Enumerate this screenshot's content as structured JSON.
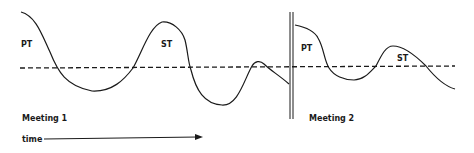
{
  "diagram": {
    "colors": {
      "line": "#1a1a1a",
      "background": "#ffffff"
    },
    "baseline": {
      "style": "dashed",
      "y": 68
    },
    "meetings": [
      {
        "label": "Meeting 1",
        "phase_labels": [
          {
            "text": "PT"
          },
          {
            "text": "ST"
          }
        ]
      },
      {
        "label": "Meeting 2",
        "phase_labels": [
          {
            "text": "PT"
          },
          {
            "text": "ST"
          }
        ]
      }
    ],
    "time_axis": {
      "label": "time",
      "direction": "right"
    },
    "separator": {
      "style": "double-vertical-line"
    }
  }
}
